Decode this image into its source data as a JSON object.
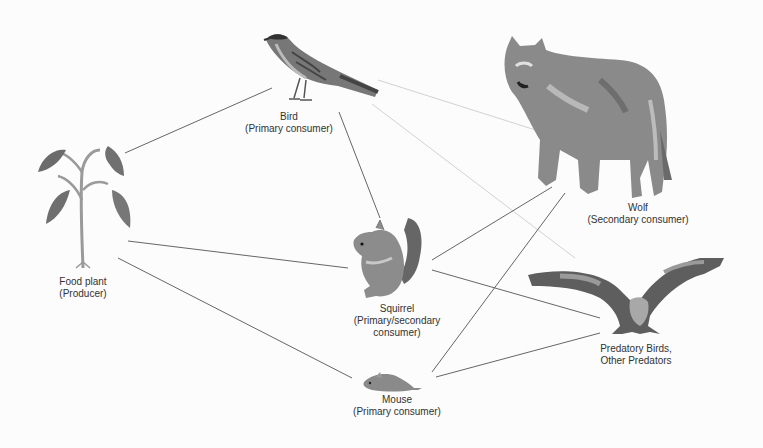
{
  "diagram": {
    "colors": {
      "background": "#fbfcfb",
      "line": "#555555",
      "faint_line": "#cfd3d3",
      "organism_dark": "#5a5a5a",
      "organism_mid": "#8e8e8e",
      "organism_light": "#bdbdbd",
      "text": "#333333"
    },
    "nodes": [
      {
        "id": "plant",
        "name": "Food plant",
        "role": "(Producer)",
        "x": 83,
        "y": 275
      },
      {
        "id": "bird",
        "name": "Bird",
        "role": "(Primary consumer)",
        "x": 289,
        "y": 116
      },
      {
        "id": "squirrel",
        "name": "Squirrel",
        "role_line1": "(Primary/secondary",
        "role_line2": "consumer)",
        "x": 397,
        "y": 306
      },
      {
        "id": "mouse",
        "name": "Mouse",
        "role": "(Primary consumer)",
        "x": 397,
        "y": 400
      },
      {
        "id": "wolf",
        "name": "Wolf",
        "role": "(Secondary consumer)",
        "x": 637,
        "y": 205
      },
      {
        "id": "predator",
        "name": "Predatory Birds,",
        "role": "Other Predators",
        "x": 636,
        "y": 347
      }
    ],
    "edges": [
      {
        "from": "plant",
        "to": "bird",
        "x1": 125,
        "y1": 153,
        "x2": 272,
        "y2": 88,
        "faint": false
      },
      {
        "from": "plant",
        "to": "squirrel",
        "x1": 128,
        "y1": 241,
        "x2": 348,
        "y2": 268,
        "faint": false
      },
      {
        "from": "plant",
        "to": "mouse",
        "x1": 118,
        "y1": 258,
        "x2": 352,
        "y2": 378,
        "faint": false
      },
      {
        "from": "bird",
        "to": "squirrel",
        "x1": 339,
        "y1": 112,
        "x2": 380,
        "y2": 218,
        "faint": false
      },
      {
        "from": "bird",
        "to": "wolf",
        "x1": 378,
        "y1": 80,
        "x2": 545,
        "y2": 133,
        "faint": true
      },
      {
        "from": "bird",
        "to": "predator",
        "x1": 372,
        "y1": 104,
        "x2": 575,
        "y2": 258,
        "faint": true
      },
      {
        "from": "squirrel",
        "to": "wolf",
        "x1": 432,
        "y1": 260,
        "x2": 552,
        "y2": 187,
        "faint": false
      },
      {
        "from": "squirrel",
        "to": "predator",
        "x1": 432,
        "y1": 270,
        "x2": 600,
        "y2": 318,
        "faint": false
      },
      {
        "from": "mouse",
        "to": "wolf",
        "x1": 432,
        "y1": 372,
        "x2": 565,
        "y2": 193,
        "faint": false
      },
      {
        "from": "mouse",
        "to": "predator",
        "x1": 436,
        "y1": 377,
        "x2": 600,
        "y2": 333,
        "faint": false
      }
    ]
  }
}
